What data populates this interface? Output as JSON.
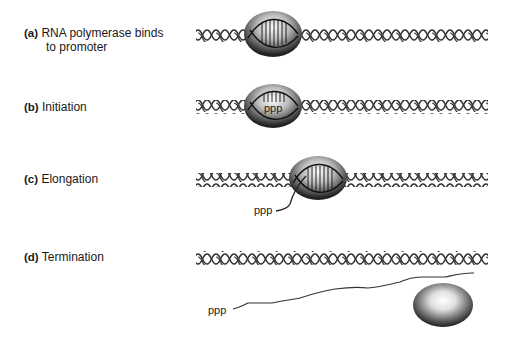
{
  "steps": [
    {
      "letter": "(a)",
      "text_line1": "RNA polymerase binds",
      "text_line2": "to promoter"
    },
    {
      "letter": "(b)",
      "text": "Initiation"
    },
    {
      "letter": "(c)",
      "text": "Elongation"
    },
    {
      "letter": "(d)",
      "text": "Termination"
    }
  ],
  "annotations": {
    "ppp_c": "ppp",
    "ppp_b": "ppp",
    "ppp_d": "ppp"
  },
  "colors": {
    "dna": "#333333",
    "polymerase_light": "#f2f2f2",
    "polymerase_dark": "#222222"
  }
}
